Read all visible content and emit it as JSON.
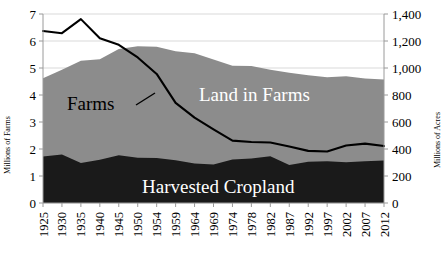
{
  "chart_data": {
    "type": "area",
    "title": "",
    "xlabel": "",
    "ylabel": "Millions of Farms",
    "y2label": "Millions of Acres",
    "ylim": [
      0,
      7
    ],
    "y2lim": [
      0,
      1400
    ],
    "grid": true,
    "legend_position": "inline-annotations",
    "categories": [
      "1925",
      "1930",
      "1935",
      "1940",
      "1945",
      "1950",
      "1954",
      "1959",
      "1964",
      "1969",
      "1974",
      "1978",
      "1982",
      "1987",
      "1992",
      "1997",
      "2002",
      "2007",
      "2012"
    ],
    "y_ticks": [
      "0",
      "1",
      "2",
      "3",
      "4",
      "5",
      "6",
      "7"
    ],
    "y2_ticks": [
      "0",
      "200",
      "400",
      "600",
      "800",
      "1,000",
      "1,200",
      "1,400"
    ],
    "series": [
      {
        "name": "Land in Farms",
        "type": "area",
        "axis": "right",
        "units": "Millions of Acres",
        "color": "#8c8c8c",
        "label_color": "#ffffff",
        "values": [
          924,
          987,
          1054,
          1065,
          1141,
          1161,
          1158,
          1124,
          1110,
          1063,
          1017,
          1015,
          987,
          964,
          946,
          932,
          938,
          922,
          915
        ]
      },
      {
        "name": "Harvested Cropland",
        "type": "area",
        "axis": "right",
        "units": "Millions of Acres",
        "color": "#1a1a1a",
        "label_color": "#ffffff",
        "values": [
          345,
          359,
          296,
          321,
          353,
          336,
          333,
          317,
          292,
          286,
          322,
          330,
          347,
          281,
          306,
          309,
          302,
          309,
          315
        ]
      },
      {
        "name": "Farms",
        "type": "line",
        "axis": "left",
        "units": "Millions of Farms",
        "color": "#000000",
        "label_color": "#000000",
        "values": [
          6.37,
          6.29,
          6.81,
          6.1,
          5.86,
          5.39,
          4.78,
          3.71,
          3.16,
          2.73,
          2.31,
          2.26,
          2.24,
          2.09,
          1.93,
          1.91,
          2.13,
          2.2,
          2.11
        ]
      }
    ],
    "annotations": [
      {
        "name": "farms-label",
        "text": "Farms",
        "color": "#000000"
      },
      {
        "name": "land-in-farms-label",
        "text": "Land in Farms",
        "color": "#ffffff"
      },
      {
        "name": "harvested-cropland-label",
        "text": "Harvested Cropland",
        "color": "#ffffff"
      }
    ],
    "colors": {
      "land_in_farms": "#8c8c8c",
      "harvested_cropland": "#1a1a1a",
      "farms_line": "#000000",
      "gridline": "#d9d9d9",
      "axis": "#9a9a9a",
      "background": "#ffffff"
    }
  }
}
